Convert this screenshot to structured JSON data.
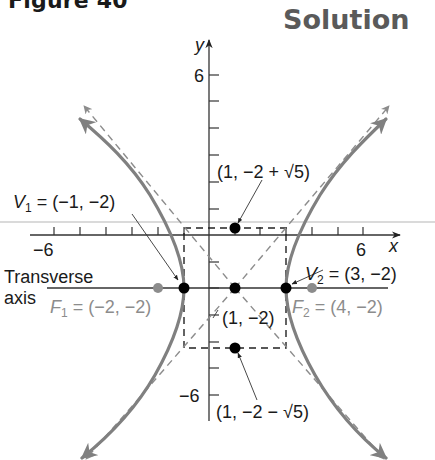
{
  "header": {
    "figure_label": "Figure 40",
    "solution_label": "Solution"
  },
  "graph": {
    "axes": {
      "x_label": "x",
      "y_label": "y",
      "x_tick_labels": {
        "min": "−6",
        "max": "6"
      },
      "y_tick_labels": {
        "max": "6",
        "min": "−6"
      },
      "x_range": [
        -6,
        6
      ],
      "y_range": [
        -6,
        6
      ]
    },
    "hyperbola": {
      "equation": "(x − 1)²/4 − (y + 2)²/5 = 1",
      "center": [
        1,
        -2
      ],
      "a": 2,
      "b": "√5"
    },
    "labels": {
      "v1_name": "V",
      "v1_sub": "1",
      "v1_value": " = (−1, −2)",
      "v2_name": "V",
      "v2_sub": "2",
      "v2_value": " = (3, −2)",
      "f1_name": "F",
      "f1_sub": "1",
      "f1_value": " = (−2, −2)",
      "f2_name": "F",
      "f2_sub": "2",
      "f2_value": " = (4, −2)",
      "center": "(1, −2)",
      "top_point": "(1, −2 + √5)",
      "bottom_point": "(1, −2 − √5)",
      "transverse_line1": "Transverse",
      "transverse_line2": "axis"
    },
    "colors": {
      "curve": "#808080",
      "asymptote": "#8c8c8c",
      "focus": "#8c8c8c",
      "point": "#000000",
      "axis": "#333333"
    }
  }
}
